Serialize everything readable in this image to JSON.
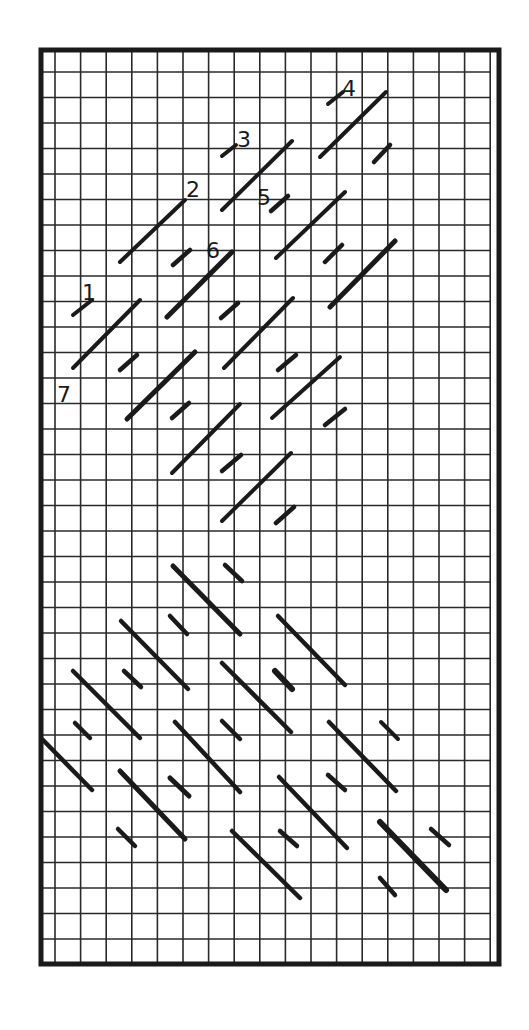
{
  "figure": {
    "frame": {
      "x": 41,
      "y": 50,
      "width": 458,
      "height": 914,
      "stroke": "#1a1a1a",
      "stroke_width": 5
    },
    "grid": {
      "x_start": 55,
      "x_step": 25.6,
      "x_count": 18,
      "y_start": 72,
      "y_step": 25.5,
      "y_count": 35,
      "stroke": "#2a2a2a",
      "stroke_width": 1.6
    },
    "colors": {
      "segment": "#1a1a1a",
      "background": "#ffffff"
    },
    "labels": [
      {
        "text": "1",
        "x": 82,
        "y": 300
      },
      {
        "text": "2",
        "x": 186,
        "y": 197
      },
      {
        "text": "3",
        "x": 237,
        "y": 147
      },
      {
        "text": "4",
        "x": 342,
        "y": 96
      },
      {
        "text": "5",
        "x": 257,
        "y": 205
      },
      {
        "text": "6",
        "x": 206,
        "y": 258
      },
      {
        "text": "7",
        "x": 57,
        "y": 402
      }
    ],
    "upper_segments": [
      {
        "x1": 328,
        "y1": 104,
        "x2": 343,
        "y2": 92,
        "w": 4
      },
      {
        "x1": 320,
        "y1": 157,
        "x2": 386,
        "y2": 92,
        "w": 4
      },
      {
        "x1": 374,
        "y1": 162,
        "x2": 390,
        "y2": 145,
        "w": 4.5
      },
      {
        "x1": 222,
        "y1": 156,
        "x2": 236,
        "y2": 145,
        "w": 4
      },
      {
        "x1": 222,
        "y1": 210,
        "x2": 292,
        "y2": 141,
        "w": 4
      },
      {
        "x1": 120,
        "y1": 262,
        "x2": 185,
        "y2": 200,
        "w": 4
      },
      {
        "x1": 271,
        "y1": 211,
        "x2": 288,
        "y2": 196,
        "w": 4.5
      },
      {
        "x1": 276,
        "y1": 258,
        "x2": 345,
        "y2": 192,
        "w": 4
      },
      {
        "x1": 325,
        "y1": 262,
        "x2": 342,
        "y2": 245,
        "w": 4.5
      },
      {
        "x1": 330,
        "y1": 307,
        "x2": 395,
        "y2": 241,
        "w": 5
      },
      {
        "x1": 173,
        "y1": 265,
        "x2": 190,
        "y2": 250,
        "w": 4.5
      },
      {
        "x1": 167,
        "y1": 317,
        "x2": 232,
        "y2": 252,
        "w": 5
      },
      {
        "x1": 73,
        "y1": 315,
        "x2": 92,
        "y2": 300,
        "w": 4
      },
      {
        "x1": 73,
        "y1": 368,
        "x2": 140,
        "y2": 300,
        "w": 4
      },
      {
        "x1": 120,
        "y1": 370,
        "x2": 137,
        "y2": 355,
        "w": 4.5
      },
      {
        "x1": 221,
        "y1": 318,
        "x2": 238,
        "y2": 303,
        "w": 4.5
      },
      {
        "x1": 224,
        "y1": 368,
        "x2": 293,
        "y2": 298,
        "w": 4
      },
      {
        "x1": 278,
        "y1": 370,
        "x2": 296,
        "y2": 355,
        "w": 4.5
      },
      {
        "x1": 127,
        "y1": 419,
        "x2": 195,
        "y2": 352,
        "w": 5
      },
      {
        "x1": 172,
        "y1": 418,
        "x2": 189,
        "y2": 403,
        "w": 4.5
      },
      {
        "x1": 272,
        "y1": 418,
        "x2": 340,
        "y2": 357,
        "w": 4
      },
      {
        "x1": 325,
        "y1": 425,
        "x2": 345,
        "y2": 409,
        "w": 4.5
      },
      {
        "x1": 172,
        "y1": 473,
        "x2": 240,
        "y2": 404,
        "w": 4
      },
      {
        "x1": 222,
        "y1": 471,
        "x2": 241,
        "y2": 455,
        "w": 4.5
      },
      {
        "x1": 222,
        "y1": 521,
        "x2": 291,
        "y2": 453,
        "w": 4
      },
      {
        "x1": 276,
        "y1": 523,
        "x2": 294,
        "y2": 507,
        "w": 4.5
      }
    ],
    "lower_segments": [
      {
        "x1": 173,
        "y1": 566,
        "x2": 240,
        "y2": 634,
        "w": 5
      },
      {
        "x1": 225,
        "y1": 565,
        "x2": 242,
        "y2": 581,
        "w": 4.5
      },
      {
        "x1": 170,
        "y1": 616,
        "x2": 187,
        "y2": 634,
        "w": 4.5
      },
      {
        "x1": 121,
        "y1": 621,
        "x2": 188,
        "y2": 689,
        "w": 4.5
      },
      {
        "x1": 124,
        "y1": 671,
        "x2": 141,
        "y2": 687,
        "w": 4.5
      },
      {
        "x1": 73,
        "y1": 671,
        "x2": 140,
        "y2": 738,
        "w": 4.5
      },
      {
        "x1": 278,
        "y1": 616,
        "x2": 345,
        "y2": 685,
        "w": 4.5
      },
      {
        "x1": 222,
        "y1": 663,
        "x2": 291,
        "y2": 732,
        "w": 4.5
      },
      {
        "x1": 275,
        "y1": 671,
        "x2": 292,
        "y2": 689,
        "w": 6
      },
      {
        "x1": 222,
        "y1": 721,
        "x2": 240,
        "y2": 739,
        "w": 4.5
      },
      {
        "x1": 175,
        "y1": 722,
        "x2": 240,
        "y2": 792,
        "w": 4.5
      },
      {
        "x1": 329,
        "y1": 722,
        "x2": 396,
        "y2": 791,
        "w": 4.5
      },
      {
        "x1": 381,
        "y1": 722,
        "x2": 398,
        "y2": 739,
        "w": 4
      },
      {
        "x1": 75,
        "y1": 723,
        "x2": 90,
        "y2": 738,
        "w": 4.5
      },
      {
        "x1": 43,
        "y1": 740,
        "x2": 92,
        "y2": 790,
        "w": 4.5
      },
      {
        "x1": 120,
        "y1": 771,
        "x2": 185,
        "y2": 839,
        "w": 5
      },
      {
        "x1": 170,
        "y1": 778,
        "x2": 189,
        "y2": 796,
        "w": 5
      },
      {
        "x1": 328,
        "y1": 775,
        "x2": 345,
        "y2": 790,
        "w": 4.5
      },
      {
        "x1": 279,
        "y1": 777,
        "x2": 347,
        "y2": 848,
        "w": 4.5
      },
      {
        "x1": 118,
        "y1": 829,
        "x2": 135,
        "y2": 846,
        "w": 4.5
      },
      {
        "x1": 280,
        "y1": 831,
        "x2": 297,
        "y2": 846,
        "w": 4.5
      },
      {
        "x1": 232,
        "y1": 831,
        "x2": 300,
        "y2": 898,
        "w": 4.5
      },
      {
        "x1": 380,
        "y1": 822,
        "x2": 446,
        "y2": 890,
        "w": 6
      },
      {
        "x1": 431,
        "y1": 829,
        "x2": 449,
        "y2": 845,
        "w": 4.5
      },
      {
        "x1": 380,
        "y1": 878,
        "x2": 395,
        "y2": 895,
        "w": 4.5
      }
    ]
  }
}
